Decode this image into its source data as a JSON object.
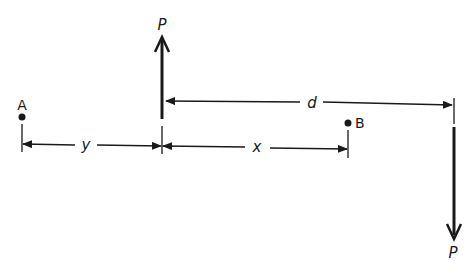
{
  "diagram": {
    "forces": [
      {
        "label": "P",
        "direction": "up",
        "x": 162
      },
      {
        "label": "P",
        "direction": "down",
        "x": 454
      }
    ],
    "points": [
      {
        "label": "A"
      },
      {
        "label": "B"
      }
    ],
    "dimensions": {
      "d": "d",
      "y": "y",
      "x": "x"
    },
    "colors": {
      "ink": "#1a1a1a",
      "background": "#ffffff"
    }
  }
}
